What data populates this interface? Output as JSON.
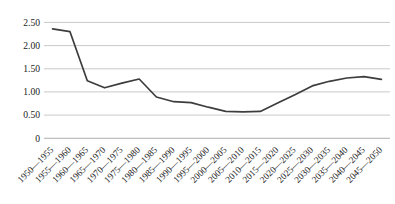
{
  "chart": {
    "background_color": "#ffffff",
    "line_color": "#3d3d3d",
    "gridline_color": "#c9c9c9",
    "axis_line_color": "#aeaeae",
    "text_color": "#1c1c1c"
  },
  "chart_data": {
    "type": "line",
    "title": "",
    "xlabel": "",
    "ylabel": "",
    "categories": [
      "1950—1955",
      "1955—1960",
      "1960—1965",
      "1965—1970",
      "1970—1975",
      "1975—1980",
      "1980—1985",
      "1985—1990",
      "1990—1995",
      "1995—2000",
      "2000—2005",
      "2005—2010",
      "2010—2015",
      "2015—2020",
      "2020—2025",
      "2025—2030",
      "2030—2035",
      "2035—2040",
      "2040—2045",
      "2045—2050"
    ],
    "series": [
      {
        "name": "series-1",
        "values": [
          2.36,
          2.3,
          1.24,
          1.09,
          1.19,
          1.28,
          0.89,
          0.79,
          0.77,
          0.67,
          0.58,
          0.57,
          0.58,
          0.76,
          0.94,
          1.13,
          1.23,
          1.3,
          1.33,
          1.27
        ]
      }
    ],
    "ylim": [
      0,
      2.5
    ],
    "y_ticks": [
      {
        "value": 0.0,
        "label": "0"
      },
      {
        "value": 0.5,
        "label": "0.50"
      },
      {
        "value": 1.0,
        "label": "1.00"
      },
      {
        "value": 1.5,
        "label": "1.50"
      },
      {
        "value": 2.0,
        "label": "2.00"
      },
      {
        "value": 2.5,
        "label": "2.50"
      }
    ],
    "grid": true,
    "legend": "none",
    "x_label_rotation_deg": -45
  }
}
